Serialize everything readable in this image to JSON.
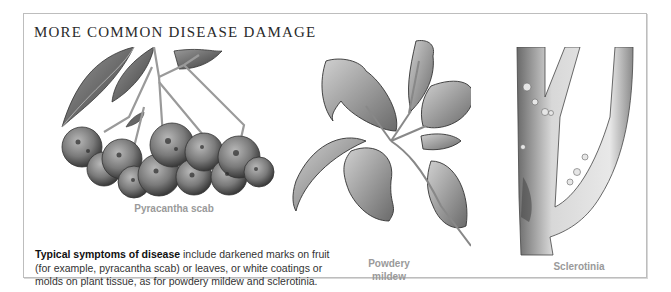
{
  "heading": "MORE COMMON DISEASE DAMAGE",
  "figures": [
    {
      "id": "pyracantha-scab",
      "label": "Pyracantha scab",
      "icon": "pyracantha-berries-illustration"
    },
    {
      "id": "powdery-mildew",
      "label_line1": "Powdery",
      "label_line2": "mildew",
      "icon": "powdery-mildew-leaves-illustration"
    },
    {
      "id": "sclerotinia",
      "label": "Sclerotinia",
      "icon": "sclerotinia-stem-illustration"
    }
  ],
  "body": {
    "lead_bold": "Typical symptoms of disease",
    "rest": " include darkened marks on fruit (for example, pyracantha scab) or leaves, or white coatings or molds on plant tissue, as for powdery mildew and sclerotinia."
  }
}
